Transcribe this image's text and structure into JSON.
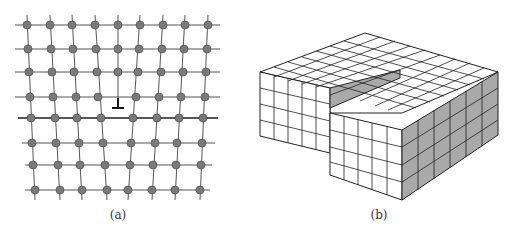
{
  "figure": {
    "panels": [
      {
        "id": "a",
        "caption": "(a)",
        "description": "Crystal lattice with edge dislocation; atoms as grey spheres connected by bonds, dislocation symbol ⊥ at center",
        "symbol": "⊥",
        "colors": {
          "atom": "#7a7a7a",
          "bond": "#555555"
        }
      },
      {
        "id": "b",
        "caption": "(b)",
        "description": "Isometric block of cubes with a screw dislocation step; shaded side faces",
        "colors": {
          "top": "#ffffff",
          "side": "#a9a9a9",
          "line": "#222222"
        }
      }
    ]
  }
}
